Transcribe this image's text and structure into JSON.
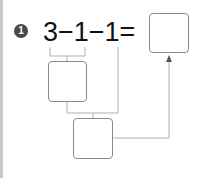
{
  "problem": {
    "number": "1",
    "expression": "3−1−1=",
    "answer_box_value": "",
    "step1_box_value": "",
    "step2_box_value": ""
  },
  "colors": {
    "badge": "#4a4a4a",
    "lines": "#b0b0b0",
    "box_border": "#8a8a8a"
  }
}
